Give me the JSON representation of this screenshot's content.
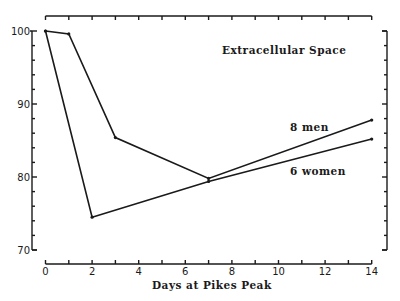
{
  "chart_data": {
    "type": "line",
    "title": "Extracellular Space",
    "xlabel": "Days at Pikes Peak",
    "ylabel": "",
    "xlim": [
      0,
      14
    ],
    "ylim": [
      70,
      100
    ],
    "x_ticks": [
      0,
      2,
      4,
      6,
      8,
      10,
      12,
      14
    ],
    "x_tick_labels": [
      "0",
      "2",
      "4",
      "6",
      "8",
      "10",
      "12",
      "14"
    ],
    "y_ticks": [
      70,
      80,
      90,
      100
    ],
    "y_tick_labels": [
      "70",
      "80",
      "90",
      "100"
    ],
    "grid": false,
    "legend": "inline labels",
    "series": [
      {
        "name": "8 men",
        "x": [
          0,
          1,
          3,
          7,
          14
        ],
        "values": [
          100,
          99.6,
          85.4,
          79.8,
          87.8
        ]
      },
      {
        "name": "6 women",
        "x": [
          0,
          2,
          7,
          14
        ],
        "values": [
          100,
          74.5,
          79.4,
          85.2
        ]
      }
    ]
  },
  "labels": {
    "title": "Extracellular Space",
    "xlabel": "Days at Pikes Peak",
    "men": "8 men",
    "women": "6 women"
  },
  "colors": {
    "ink": "#1a1a1a",
    "background": "#ffffff"
  }
}
